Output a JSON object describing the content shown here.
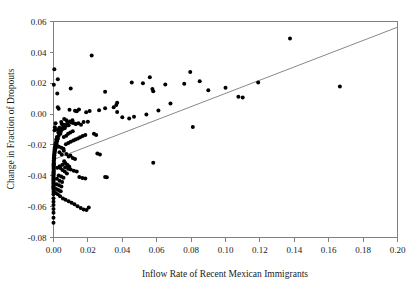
{
  "chart_data": {
    "type": "scatter",
    "title": "",
    "xlabel": "Inflow Rate of Recent Mexican Immigrants",
    "ylabel": "Change in Fraction of Dropouts",
    "xlim": [
      0.0,
      0.2
    ],
    "ylim": [
      -0.08,
      0.06
    ],
    "xticks": [
      0.0,
      0.02,
      0.04,
      0.06,
      0.08,
      0.1,
      0.12,
      0.14,
      0.16,
      0.18,
      0.2
    ],
    "xticklabels": [
      "0.00",
      "0.02",
      "0.04",
      "0.06",
      "0.08",
      "0.10",
      "0.12",
      "0.14",
      "0.16",
      "0.18",
      "0.20"
    ],
    "yticks": [
      -0.08,
      -0.06,
      -0.04,
      -0.02,
      0.0,
      0.02,
      0.04,
      0.06
    ],
    "yticklabels": [
      "-0.08",
      "-0.06",
      "-0.04",
      "-0.02",
      "0.00",
      "0.02",
      "0.04",
      "0.06"
    ],
    "grid": false,
    "legend": null,
    "marker_color": "#000000",
    "marker_size": 2.0,
    "fit_line": {
      "label": "regression line",
      "color": "#7a7a7a",
      "x_start": 0.0,
      "y_start": -0.0295,
      "x_end": 0.2,
      "y_end": 0.0563
    },
    "points": [
      [
        0.0005,
        0.029
      ],
      [
        0.0002,
        0.019
      ],
      [
        0.0025,
        0.0225
      ],
      [
        0.0022,
        0.0133
      ],
      [
        0.01,
        0.0165
      ],
      [
        0.0222,
        0.038
      ],
      [
        0.03,
        0.0145
      ],
      [
        0.037,
        0.0073
      ],
      [
        0.0455,
        0.0205
      ],
      [
        0.052,
        0.02
      ],
      [
        0.056,
        0.0238
      ],
      [
        0.0575,
        0.0162
      ],
      [
        0.058,
        0.0148
      ],
      [
        0.065,
        0.0192
      ],
      [
        0.076,
        0.0197
      ],
      [
        0.0795,
        0.0272
      ],
      [
        0.085,
        0.0213
      ],
      [
        0.09,
        0.0155
      ],
      [
        0.1,
        0.017
      ],
      [
        0.1075,
        0.0113
      ],
      [
        0.11,
        0.0108
      ],
      [
        0.119,
        0.0205
      ],
      [
        0.1375,
        0.049
      ],
      [
        0.1665,
        0.0178
      ],
      [
        0.0025,
        0.0045
      ],
      [
        0.003,
        0.0035
      ],
      [
        0.0093,
        0.0028
      ],
      [
        0.0125,
        0.0022
      ],
      [
        0.0135,
        0.0018
      ],
      [
        0.0148,
        0.003
      ],
      [
        0.019,
        0.0012
      ],
      [
        0.021,
        0.002
      ],
      [
        0.0265,
        0.0025
      ],
      [
        0.03,
        0.0037
      ],
      [
        0.035,
        0.0045
      ],
      [
        0.0365,
        0.0058
      ],
      [
        0.037,
        0.0013
      ],
      [
        0.04,
        -0.002
      ],
      [
        0.044,
        -0.0028
      ],
      [
        0.0468,
        -0.0018
      ],
      [
        0.054,
        -0.0003
      ],
      [
        0.061,
        0.0023
      ],
      [
        0.068,
        0.0068
      ],
      [
        0.081,
        -0.0083
      ],
      [
        0.02,
        -0.005
      ],
      [
        0.0175,
        -0.0052
      ],
      [
        0.0145,
        -0.006
      ],
      [
        0.0128,
        -0.0062
      ],
      [
        0.011,
        -0.004
      ],
      [
        0.0105,
        -0.0055
      ],
      [
        0.0095,
        -0.0048
      ],
      [
        0.0088,
        -0.0072
      ],
      [
        0.008,
        -0.006
      ],
      [
        0.0072,
        -0.0078
      ],
      [
        0.0065,
        -0.0092
      ],
      [
        0.006,
        -0.007
      ],
      [
        0.0055,
        -0.0085
      ],
      [
        0.005,
        -0.01
      ],
      [
        0.0048,
        -0.0065
      ],
      [
        0.0045,
        -0.0052
      ],
      [
        0.0042,
        -0.0115
      ],
      [
        0.004,
        -0.0128
      ],
      [
        0.0036,
        -0.0098
      ],
      [
        0.0034,
        -0.0088
      ],
      [
        0.003,
        -0.014
      ],
      [
        0.0028,
        -0.012
      ],
      [
        0.0026,
        -0.0158
      ],
      [
        0.0024,
        -0.0102
      ],
      [
        0.0022,
        -0.0175
      ],
      [
        0.002,
        -0.0148
      ],
      [
        0.0018,
        -0.0192
      ],
      [
        0.0016,
        -0.0165
      ],
      [
        0.0015,
        -0.0208
      ],
      [
        0.0014,
        -0.0182
      ],
      [
        0.0012,
        -0.0222
      ],
      [
        0.001,
        -0.0198
      ],
      [
        0.0009,
        -0.0238
      ],
      [
        0.0008,
        -0.0215
      ],
      [
        0.0007,
        -0.0252
      ],
      [
        0.0006,
        -0.023
      ],
      [
        0.0005,
        -0.0268
      ],
      [
        0.0005,
        -0.0245
      ],
      [
        0.0004,
        -0.0282
      ],
      [
        0.0004,
        -0.0258
      ],
      [
        0.0003,
        -0.0295
      ],
      [
        0.0003,
        -0.0272
      ],
      [
        0.0002,
        -0.031
      ],
      [
        0.0002,
        -0.0288
      ],
      [
        0.0002,
        -0.0325
      ],
      [
        0.0001,
        -0.0302
      ],
      [
        0.0001,
        -0.034
      ],
      [
        0.0001,
        -0.0318
      ],
      [
        0.0001,
        -0.0355
      ],
      [
        0.0001,
        -0.0332
      ],
      [
        0.0001,
        -0.037
      ],
      [
        0.0001,
        -0.0348
      ],
      [
        0.0001,
        -0.0385
      ],
      [
        0.0001,
        -0.0362
      ],
      [
        0.0,
        -0.04
      ],
      [
        0.0,
        -0.0378
      ],
      [
        0.0,
        -0.0415
      ],
      [
        0.0,
        -0.0392
      ],
      [
        0.0,
        -0.043
      ],
      [
        0.0,
        -0.0408
      ],
      [
        0.0,
        -0.0445
      ],
      [
        0.0,
        -0.0422
      ],
      [
        0.0,
        -0.046
      ],
      [
        0.0,
        -0.0438
      ],
      [
        0.0,
        -0.0475
      ],
      [
        0.0,
        -0.0452
      ],
      [
        0.0,
        -0.049
      ],
      [
        0.0,
        -0.0468
      ],
      [
        0.0,
        -0.0505
      ],
      [
        0.0,
        -0.0482
      ],
      [
        0.0,
        -0.052
      ],
      [
        0.0,
        -0.0545
      ],
      [
        0.0,
        -0.0568
      ],
      [
        0.0,
        -0.059
      ],
      [
        0.0,
        -0.0615
      ],
      [
        0.0,
        -0.064
      ],
      [
        0.0,
        -0.0672
      ],
      [
        0.0,
        -0.0705
      ],
      [
        0.0035,
        -0.0248
      ],
      [
        0.0048,
        -0.0262
      ],
      [
        0.006,
        -0.0238
      ],
      [
        0.0075,
        -0.0258
      ],
      [
        0.0088,
        -0.0275
      ],
      [
        0.0098,
        -0.0268
      ],
      [
        0.0112,
        -0.0285
      ],
      [
        0.0125,
        -0.0292
      ],
      [
        0.0062,
        -0.0305
      ],
      [
        0.007,
        -0.0318
      ],
      [
        0.0082,
        -0.033
      ],
      [
        0.0092,
        -0.0342
      ],
      [
        0.004,
        -0.035
      ],
      [
        0.0052,
        -0.0362
      ],
      [
        0.0065,
        -0.0372
      ],
      [
        0.0078,
        -0.0385
      ],
      [
        0.003,
        -0.0398
      ],
      [
        0.0045,
        -0.0405
      ],
      [
        0.0058,
        -0.0412
      ],
      [
        0.002,
        -0.042
      ],
      [
        0.0035,
        -0.0432
      ],
      [
        0.005,
        -0.044
      ],
      [
        0.0018,
        -0.0455
      ],
      [
        0.0032,
        -0.0462
      ],
      [
        0.0046,
        -0.047
      ],
      [
        0.0015,
        -0.0485
      ],
      [
        0.0028,
        -0.0492
      ],
      [
        0.0042,
        -0.05
      ],
      [
        0.0012,
        -0.0512
      ],
      [
        0.0025,
        -0.052
      ],
      [
        0.0038,
        -0.0532
      ],
      [
        0.0055,
        -0.0548
      ],
      [
        0.007,
        -0.0555
      ],
      [
        0.0088,
        -0.0565
      ],
      [
        0.0105,
        -0.0575
      ],
      [
        0.0122,
        -0.0585
      ],
      [
        0.014,
        -0.0598
      ],
      [
        0.0158,
        -0.0608
      ],
      [
        0.0175,
        -0.0618
      ],
      [
        0.0192,
        -0.0622
      ],
      [
        0.0205,
        -0.0605
      ],
      [
        0.015,
        -0.0408
      ],
      [
        0.0168,
        -0.0415
      ],
      [
        0.0185,
        -0.0418
      ],
      [
        0.03,
        -0.0408
      ],
      [
        0.031,
        -0.041
      ],
      [
        0.0255,
        -0.0255
      ],
      [
        0.027,
        -0.0262
      ],
      [
        0.058,
        -0.0315
      ],
      [
        0.0022,
        -0.0348
      ],
      [
        0.0036,
        -0.0338
      ],
      [
        0.0052,
        -0.0328
      ],
      [
        0.0068,
        -0.0345
      ],
      [
        0.0085,
        -0.0355
      ],
      [
        0.01,
        -0.036
      ],
      [
        0.0118,
        -0.0368
      ],
      [
        0.0135,
        -0.0372
      ],
      [
        0.002,
        -0.0205
      ],
      [
        0.0032,
        -0.0212
      ],
      [
        0.0046,
        -0.0218
      ],
      [
        0.0058,
        -0.0225
      ],
      [
        0.0072,
        -0.0195
      ],
      [
        0.0086,
        -0.0188
      ],
      [
        0.01,
        -0.018
      ],
      [
        0.0115,
        -0.0172
      ],
      [
        0.0128,
        -0.0165
      ],
      [
        0.0142,
        -0.0158
      ],
      [
        0.0155,
        -0.015
      ],
      [
        0.017,
        -0.0142
      ],
      [
        0.0185,
        -0.0135
      ],
      [
        0.0085,
        -0.0128
      ],
      [
        0.0098,
        -0.012
      ],
      [
        0.0112,
        -0.0112
      ],
      [
        0.006,
        -0.0148
      ],
      [
        0.0074,
        -0.014
      ],
      [
        0.0235,
        -0.0128
      ],
      [
        0.0248,
        -0.0135
      ],
      [
        0.0115,
        -0.0058
      ],
      [
        0.013,
        -0.0065
      ],
      [
        0.016,
        -0.007
      ],
      [
        0.0062,
        -0.0032
      ],
      [
        0.0075,
        -0.004
      ],
      [
        0.0012,
        -0.006
      ],
      [
        0.0008,
        -0.0085
      ],
      [
        0.0006,
        -0.0105
      ]
    ]
  }
}
